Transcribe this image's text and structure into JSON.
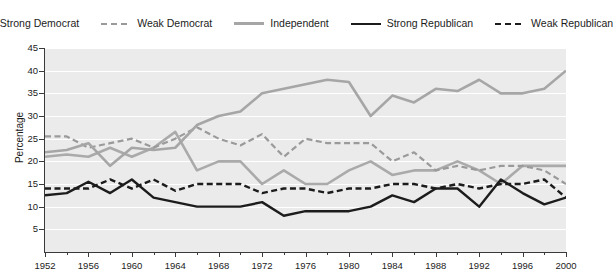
{
  "chart_data": {
    "type": "line",
    "title": "",
    "xlabel": "",
    "ylabel": "Percentage",
    "ylim": [
      0,
      45
    ],
    "xlim": [
      1952,
      2000
    ],
    "ytick_labels": [
      "5",
      "10",
      "15",
      "20",
      "25",
      "30",
      "35",
      "40",
      "45"
    ],
    "ytick_values": [
      5,
      10,
      15,
      20,
      25,
      30,
      35,
      40,
      45
    ],
    "xtick_labels": [
      "1952",
      "1956",
      "1960",
      "1964",
      "1968",
      "1972",
      "1976",
      "1980",
      "1984",
      "1988",
      "1992",
      "1996",
      "2000"
    ],
    "xtick_values": [
      1952,
      1956,
      1960,
      1964,
      1968,
      1972,
      1976,
      1980,
      1984,
      1988,
      1992,
      1996,
      2000
    ],
    "x": [
      1952,
      1954,
      1956,
      1958,
      1960,
      1962,
      1964,
      1966,
      1968,
      1970,
      1972,
      1974,
      1976,
      1978,
      1980,
      1982,
      1984,
      1986,
      1988,
      1990,
      1992,
      1994,
      1996,
      1998,
      2000
    ],
    "grid": "horizontal",
    "legend_position": "top",
    "plot_background": "#ebebeb",
    "gridline_color": "#ffffff",
    "series": [
      {
        "name": "Strong Democrat",
        "color": "#aaaaaa",
        "style": "solid",
        "width": 2.6,
        "values": [
          21.0,
          21.5,
          21.0,
          23.0,
          21.0,
          23.0,
          26.5,
          18.0,
          20.0,
          20.0,
          15.0,
          18.0,
          15.0,
          15.0,
          18.0,
          20.0,
          17.0,
          18.0,
          18.0,
          20.0,
          18.0,
          15.0,
          19.0,
          19.0,
          19.0
        ]
      },
      {
        "name": "Weak Democrat",
        "color": "#9a9a9a",
        "style": "dashed",
        "width": 2.2,
        "values": [
          25.5,
          25.5,
          23.0,
          24.0,
          25.0,
          23.0,
          25.0,
          27.5,
          25.0,
          23.5,
          26.0,
          21.0,
          25.0,
          24.0,
          24.0,
          24.0,
          20.0,
          22.0,
          18.0,
          19.0,
          18.0,
          19.0,
          19.0,
          18.0,
          15.0
        ]
      },
      {
        "name": "Independent",
        "color": "#a6a6a6",
        "style": "solid",
        "width": 2.6,
        "values": [
          22.0,
          22.5,
          24.0,
          19.0,
          23.0,
          22.5,
          23.0,
          28.0,
          30.0,
          31.0,
          35.0,
          36.0,
          37.0,
          38.0,
          37.5,
          30.0,
          34.5,
          33.0,
          36.0,
          35.5,
          38.0,
          35.0,
          35.0,
          36.0,
          40.0
        ]
      },
      {
        "name": "Strong Republican",
        "color": "#1c1c1c",
        "style": "solid",
        "width": 2.4,
        "values": [
          12.5,
          13.0,
          15.5,
          13.0,
          16.0,
          12.0,
          11.0,
          10.0,
          10.0,
          10.0,
          11.0,
          8.0,
          9.0,
          9.0,
          9.0,
          10.0,
          12.5,
          11.0,
          14.0,
          14.0,
          10.0,
          16.0,
          13.0,
          10.5,
          12.0
        ]
      },
      {
        "name": "Weak Republican",
        "color": "#1c1c1c",
        "style": "dashed",
        "width": 2.4,
        "values": [
          14.0,
          14.0,
          14.0,
          16.0,
          14.0,
          16.0,
          13.5,
          15.0,
          15.0,
          15.0,
          13.0,
          14.0,
          14.0,
          13.0,
          14.0,
          14.0,
          15.0,
          15.0,
          14.0,
          15.0,
          14.0,
          15.0,
          15.0,
          16.0,
          12.0
        ]
      }
    ]
  },
  "legend": {
    "items": [
      {
        "label": "Strong Democrat"
      },
      {
        "label": "Weak Democrat"
      },
      {
        "label": "Independent"
      },
      {
        "label": "Strong Republican"
      },
      {
        "label": "Weak Republican"
      }
    ]
  }
}
